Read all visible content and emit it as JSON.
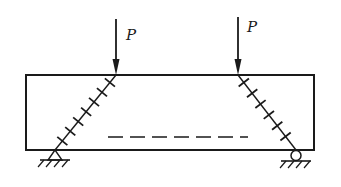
{
  "diagram": {
    "type": "simply-supported beam with two point loads and diagonal shear cracks",
    "colors": {
      "ink": "#1a1a1a",
      "background": "#ffffff"
    },
    "beam": {
      "x": 26,
      "y": 75,
      "width": 288,
      "height": 75
    },
    "loads": [
      {
        "label": "P",
        "x": 116,
        "y_start": 19,
        "y_end": 75,
        "label_x": 126,
        "label_y": 40
      },
      {
        "label": "P",
        "x": 238,
        "y_start": 17,
        "y_end": 75,
        "label_x": 247,
        "label_y": 32
      }
    ],
    "cracks": [
      {
        "name": "left-shear-crack",
        "x1": 116,
        "y1": 75,
        "x2": 55,
        "y2": 150,
        "ticks": 7,
        "t_start": 0.1,
        "t_end": 0.88
      },
      {
        "name": "right-shear-crack",
        "x1": 238,
        "y1": 75,
        "x2": 296,
        "y2": 150,
        "ticks": 6,
        "t_start": 0.1,
        "t_end": 0.82
      }
    ],
    "dashed_line": {
      "x1": 108,
      "x2": 248,
      "y": 137,
      "dash": 15,
      "gap": 7
    },
    "supports": [
      {
        "kind": "pin",
        "x": 55,
        "y": 150
      },
      {
        "kind": "roller",
        "x": 296,
        "y": 150
      }
    ]
  }
}
